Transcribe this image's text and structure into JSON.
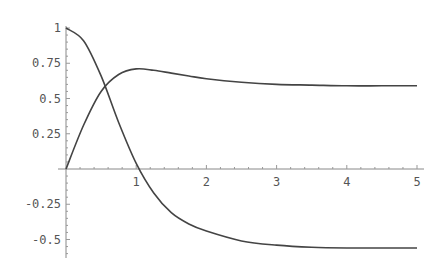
{
  "chart_data": {
    "type": "line",
    "title": "",
    "xlabel": "",
    "ylabel": "",
    "xlim": [
      0,
      5
    ],
    "ylim": [
      -0.6,
      1.0
    ],
    "grid": false,
    "legend": null,
    "x_ticks": [
      "1",
      "2",
      "3",
      "4",
      "5"
    ],
    "y_ticks": [
      "1",
      "0.75",
      "0.5",
      "0.25",
      "-0.25",
      "-0.5"
    ],
    "series": [
      {
        "name": "falling-curve",
        "x": [
          0,
          0.25,
          0.5,
          0.75,
          1.0,
          1.25,
          1.5,
          1.75,
          2.0,
          2.5,
          3.0,
          3.5,
          4.0,
          4.5,
          5.0
        ],
        "values": [
          1.0,
          0.91,
          0.66,
          0.33,
          0.04,
          -0.17,
          -0.31,
          -0.39,
          -0.44,
          -0.51,
          -0.54,
          -0.555,
          -0.56,
          -0.56,
          -0.56
        ]
      },
      {
        "name": "rising-curve",
        "x": [
          0,
          0.25,
          0.5,
          0.75,
          1.0,
          1.25,
          1.5,
          1.75,
          2.0,
          2.5,
          3.0,
          3.5,
          4.0,
          4.5,
          5.0
        ],
        "values": [
          0.0,
          0.31,
          0.55,
          0.67,
          0.71,
          0.7,
          0.68,
          0.66,
          0.64,
          0.615,
          0.6,
          0.595,
          0.59,
          0.59,
          0.59
        ]
      }
    ]
  }
}
